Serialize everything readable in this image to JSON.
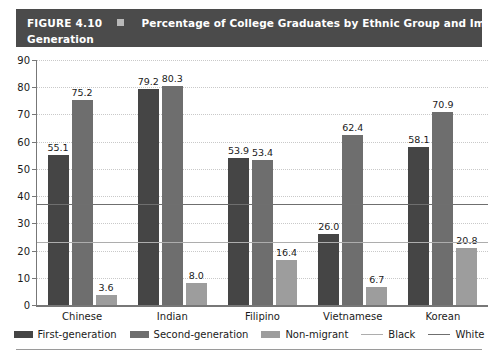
{
  "header": {
    "figure_number": "FIGURE 4.10",
    "marker_icon": "square-bullet-icon",
    "title_line1": "Percentage of College Graduates by Ethnic Group and Immigration",
    "title_line2": "Generation",
    "bg_color": "#4b4b4b",
    "text_color": "#ffffff"
  },
  "chart_data": {
    "type": "bar",
    "title": "Percentage of College Graduates by Ethnic Group and Immigration Generation",
    "xlabel": "",
    "ylabel": "",
    "ylim": [
      0,
      90
    ],
    "yticks": [
      0,
      10,
      20,
      30,
      40,
      50,
      60,
      70,
      80,
      90
    ],
    "grid": true,
    "legend_position": "bottom",
    "categories": [
      "Chinese",
      "Indian",
      "Filipino",
      "Vietnamese",
      "Korean"
    ],
    "series": [
      {
        "name": "First-generation",
        "color": "#454545",
        "values": [
          55.1,
          79.2,
          53.9,
          26.0,
          58.1
        ],
        "labels": [
          "55.1",
          "79.2",
          "53.9",
          "26.0",
          "58.1"
        ]
      },
      {
        "name": "Second-generation",
        "color": "#6e6e6e",
        "values": [
          75.2,
          80.3,
          53.4,
          62.4,
          70.9
        ],
        "labels": [
          "75.2",
          "80.3",
          "53.4",
          "62.4",
          "70.9"
        ]
      },
      {
        "name": "Non-migrant",
        "color": "#9d9d9d",
        "values": [
          3.6,
          8.0,
          16.4,
          6.7,
          20.8
        ],
        "labels": [
          "3.6",
          "8.0",
          "16.4",
          "6.7",
          "20.8"
        ]
      }
    ],
    "reference_lines": [
      {
        "name": "Black",
        "value": 23.0,
        "color": "#adadad",
        "style": "solid"
      },
      {
        "name": "White",
        "value": 37.0,
        "color": "#6f6f6f",
        "style": "solid"
      }
    ]
  },
  "legend": {
    "items": [
      {
        "label": "First-generation",
        "type": "swatch",
        "class": "s0"
      },
      {
        "label": "Second-generation",
        "type": "swatch",
        "class": "s1"
      },
      {
        "label": "Non-migrant",
        "type": "swatch",
        "class": "s2"
      },
      {
        "label": "Black",
        "type": "line",
        "class": "black"
      },
      {
        "label": "White",
        "type": "line",
        "class": "white"
      }
    ]
  }
}
